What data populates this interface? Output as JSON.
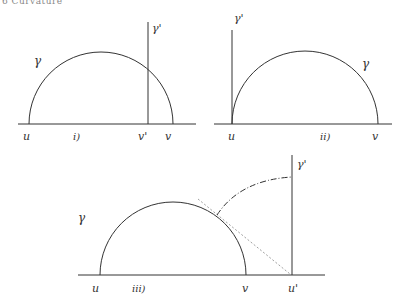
{
  "header": {
    "text": "6 Curvature"
  },
  "panels": [
    {
      "id": "i",
      "caption": "i)",
      "labels": {
        "curve": "γ",
        "line": "γ'",
        "left": "u",
        "mid": "v'",
        "right": "v"
      }
    },
    {
      "id": "ii",
      "caption": "ii)",
      "labels": {
        "curve": "γ",
        "line": "γ'",
        "left": "u",
        "right": "v"
      }
    },
    {
      "id": "iii",
      "caption": "iii)",
      "labels": {
        "curve": "γ",
        "line": "γ'",
        "left": "u",
        "mid": "v",
        "right": "u'"
      }
    }
  ],
  "colors": {
    "ink": "#333333",
    "dotted": "#888888"
  }
}
